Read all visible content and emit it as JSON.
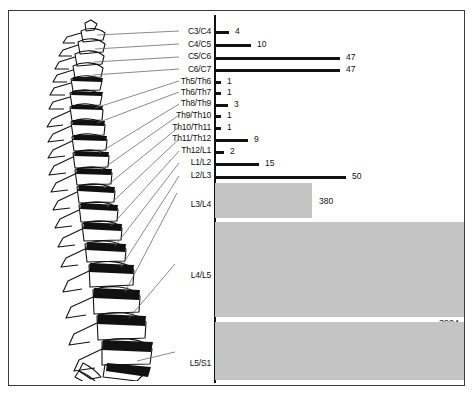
{
  "figure": {
    "axis_label_x": "",
    "spine_caption": ""
  },
  "chart_data": {
    "type": "bar",
    "orientation": "horizontal",
    "title": "",
    "xlabel": "",
    "ylabel": "",
    "grid": false,
    "legend": null,
    "xlim": [
      0,
      4100
    ],
    "categories": [
      "C3/C4",
      "C4/C5",
      "C5/C6",
      "C6/C7",
      "Th5/Th6",
      "Th6/Th7",
      "Th8/Th9",
      "Th9/Th10",
      "Th10/Th11",
      "Th11/Th12",
      "Th12/L1",
      "L1/L2",
      "L2/L3",
      "L3/L4",
      "L4/L5",
      "L5/S1"
    ],
    "values": [
      4,
      10,
      47,
      47,
      1,
      1,
      3,
      1,
      1,
      9,
      2,
      15,
      50,
      380,
      3904,
      3904
    ],
    "value_labels": [
      "4",
      "10",
      "47",
      "47",
      "1",
      "1",
      "3",
      "1",
      "1",
      "9",
      "2",
      "15",
      "50",
      "380",
      "3904",
      ""
    ],
    "bar_styles": [
      "thin",
      "thin",
      "thin",
      "thin",
      "thin",
      "thin",
      "thin",
      "thin",
      "thin",
      "thin",
      "thin",
      "thin",
      "thin",
      "thick",
      "thick",
      "thick"
    ],
    "colors": {
      "thin_bar": "#111111",
      "thick_bar": "#c4c4c4",
      "axis": "#111111",
      "text": "#111111"
    }
  },
  "rows": [
    {
      "label": "C3/C4",
      "value": "4",
      "top": 20,
      "bar_w": 14,
      "style": "thin",
      "label_top": 16
    },
    {
      "label": "C4/C5",
      "value": "10",
      "top": 33,
      "bar_w": 36,
      "style": "thin",
      "label_top": 29
    },
    {
      "label": "C5/C6",
      "value": "47",
      "top": 46,
      "bar_w": 125,
      "style": "thin",
      "label_top": 41
    },
    {
      "label": "C6/C7",
      "value": "47",
      "top": 58,
      "bar_w": 125,
      "style": "thin",
      "label_top": 54
    },
    {
      "label": "Th5/Th6",
      "value": "1",
      "top": 70,
      "bar_w": 6,
      "style": "thin",
      "label_top": 66
    },
    {
      "label": "Th6/Th7",
      "value": "1",
      "top": 81,
      "bar_w": 6,
      "style": "thin",
      "label_top": 77
    },
    {
      "label": "Th8/Th9",
      "value": "3",
      "top": 93,
      "bar_w": 13,
      "style": "thin",
      "label_top": 88
    },
    {
      "label": "Th9/Th10",
      "value": "1",
      "top": 104,
      "bar_w": 6,
      "style": "thin",
      "label_top": 100
    },
    {
      "label": "Th10/Th11",
      "value": "1",
      "top": 116,
      "bar_w": 6,
      "style": "thin",
      "label_top": 112
    },
    {
      "label": "Th11/Th12",
      "value": "9",
      "top": 128,
      "bar_w": 33,
      "style": "thin",
      "label_top": 123
    },
    {
      "label": "Th12/L1",
      "value": "2",
      "top": 140,
      "bar_w": 9,
      "style": "thin",
      "label_top": 135
    },
    {
      "label": "L1/L2",
      "value": "15",
      "top": 152,
      "bar_w": 44,
      "style": "thin",
      "label_top": 147
    },
    {
      "label": "L2/L3",
      "value": "50",
      "top": 165,
      "bar_w": 131,
      "style": "thin",
      "label_top": 160
    },
    {
      "label": "L3/L4",
      "value": "380",
      "top": 172,
      "bar_w": 97,
      "style": "thick",
      "label_top": 189
    },
    {
      "label": "L4/L5",
      "value": "3904",
      "top": 211,
      "bar_w": 250,
      "style": "thick",
      "label_top": 260
    },
    {
      "label": "L5/S1",
      "value": "",
      "top": 311,
      "bar_w": 250,
      "style": "thick",
      "label_top": 348
    }
  ]
}
